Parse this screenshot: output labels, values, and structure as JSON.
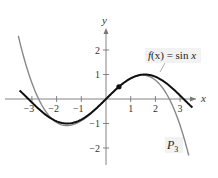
{
  "chart_data": {
    "type": "line",
    "title": "",
    "xlabel": "x",
    "ylabel": "y",
    "xlim": [
      -3.5,
      3.7
    ],
    "ylim": [
      -2.6,
      2.7
    ],
    "xticks": [
      -3,
      -2,
      -1,
      1,
      2,
      3
    ],
    "yticks": [
      -2,
      -1,
      1,
      2
    ],
    "grid": false,
    "series": [
      {
        "name": "f(x) = sin x",
        "expression": "sin(x)",
        "color": "#111111",
        "stroke_width": 2,
        "domain": [
          -3.5,
          3.5
        ]
      },
      {
        "name": "P3",
        "expression": "Taylor polynomial of sin x, degree 3, centered at pi/6",
        "center": 0.5236,
        "coefficients": [
          0.5,
          0.866,
          -0.25,
          -0.1443
        ],
        "color": "#888888",
        "stroke_width": 1.4,
        "domain": [
          -3.55,
          3.35
        ]
      }
    ],
    "marked_point": {
      "x": 0.5236,
      "y": 0.5,
      "label": ""
    },
    "annotations": [
      {
        "text": "f(x) = sin x",
        "target": "sin",
        "x": 2.4,
        "y": 1.9
      },
      {
        "text": "P3",
        "target": "P3",
        "x": 2.6,
        "y": -1.9
      }
    ]
  },
  "labels": {
    "x_axis": "x",
    "y_axis": "y",
    "sin_label_f": "f",
    "sin_label_rest": "(x) = sin ",
    "sin_label_x": "x",
    "p3_main": "P",
    "p3_sub": "3"
  }
}
